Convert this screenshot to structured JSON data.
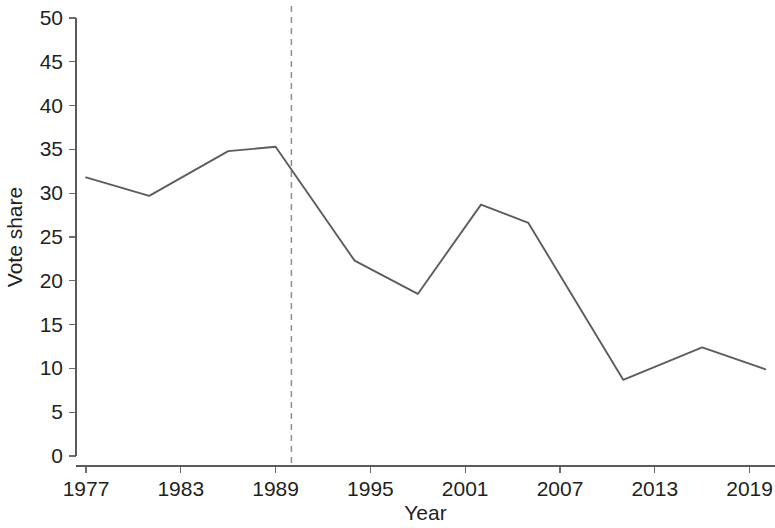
{
  "chart_data": {
    "type": "line",
    "title": "",
    "subtitle": "",
    "xlabel": "Year",
    "ylabel": "Vote share",
    "xlim": [
      1976,
      2021
    ],
    "ylim": [
      0,
      50
    ],
    "grid": false,
    "legend": null,
    "x_ticks": [
      1977,
      1983,
      1989,
      1995,
      2001,
      2007,
      2013,
      2019
    ],
    "x_tick_labels": [
      "1977",
      "1983",
      "1989",
      "1995",
      "2001",
      "2007",
      "2013",
      "2019"
    ],
    "y_ticks": [
      0,
      5,
      10,
      15,
      20,
      25,
      30,
      35,
      40,
      45,
      50
    ],
    "y_tick_labels": [
      "0",
      "5",
      "10",
      "15",
      "20",
      "25",
      "30",
      "35",
      "40",
      "45",
      "50"
    ],
    "series": [
      {
        "name": "Vote share",
        "color": "#5d5d5d",
        "x": [
          1977,
          1981,
          1986,
          1989,
          1994,
          1998,
          2002,
          2005,
          2011,
          2016,
          2020
        ],
        "values": [
          31.8,
          29.7,
          34.8,
          35.3,
          22.3,
          18.5,
          28.7,
          26.6,
          8.7,
          12.4,
          9.9
        ]
      }
    ],
    "annotations": [
      {
        "type": "vertical-reference-line",
        "x": 1990,
        "style": "dashed",
        "color": "#8d8d8d",
        "label": ""
      }
    ]
  },
  "axes": {
    "y_axis_label": "Vote share",
    "x_axis_label": "Year"
  }
}
